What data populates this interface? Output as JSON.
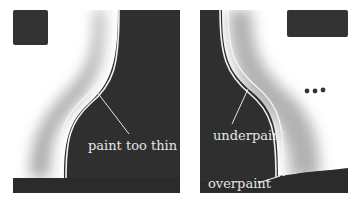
{
  "figure": {
    "panels": [
      {
        "id": "left",
        "annotation": "paint too thin"
      },
      {
        "id": "right",
        "annotations": [
          "underpaint",
          "overpaint"
        ],
        "ellipsis": "•••"
      }
    ]
  },
  "colors": {
    "dark": "#2f2f2f",
    "light": "#ffffff",
    "stroke": "#f2f2f2",
    "label": "#e6e6e6"
  }
}
